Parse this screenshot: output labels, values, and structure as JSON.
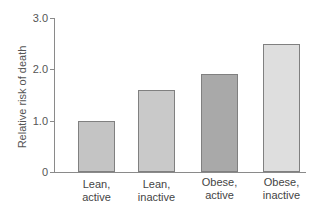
{
  "chart_data": {
    "type": "bar",
    "title": "",
    "xlabel": "",
    "ylabel": "Relative risk of death",
    "ylim": [
      0,
      3.0
    ],
    "yticks": [
      "0",
      "1.0",
      "2.0",
      "3.0"
    ],
    "grid": false,
    "legend": null,
    "categories": [
      "Lean, active",
      "Lean, inactive",
      "Obese, active",
      "Obese, inactive"
    ],
    "category_lines": [
      [
        "Lean,",
        "active"
      ],
      [
        "Lean,",
        "inactive"
      ],
      [
        "Obese,",
        "active"
      ],
      [
        "Obese,",
        "inactive"
      ]
    ],
    "values": [
      1.0,
      1.6,
      1.9,
      2.5
    ],
    "colors": [
      "#c4c4c4",
      "#c9c9c9",
      "#a9a9a9",
      "#dedede"
    ]
  }
}
